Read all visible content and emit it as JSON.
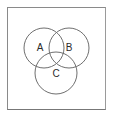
{
  "figure": {
    "kind": "venn-diagram",
    "frame": {
      "border_color": "#8a8a8a",
      "background_color": "#ffffff"
    },
    "stroke_color": "#6f6f6f",
    "label_color": "#2b2b2b",
    "sets": [
      {
        "id": "A",
        "label": "A",
        "cx": 44,
        "cy": 48,
        "r": 20,
        "label_x": 40,
        "label_y": 48
      },
      {
        "id": "B",
        "label": "B",
        "cx": 69,
        "cy": 48,
        "r": 20,
        "label_x": 69,
        "label_y": 48
      },
      {
        "id": "C",
        "label": "C",
        "cx": 56,
        "cy": 73,
        "r": 21,
        "label_x": 56,
        "label_y": 74
      }
    ]
  }
}
